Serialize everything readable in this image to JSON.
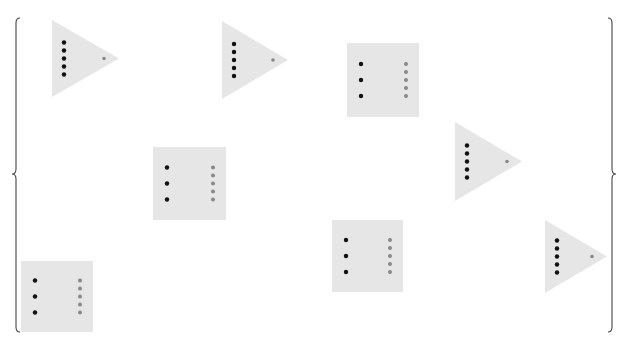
{
  "diagram": {
    "background": "#ffffff",
    "shape_fill": "#e6e6e6",
    "primary_dot_color": "#111111",
    "secondary_dot_color": "#888888",
    "brace_color": "#444444",
    "braces": [
      {
        "side": "left",
        "x": 16,
        "y_top": 18,
        "y_bottom": 332,
        "y_mid": 174
      },
      {
        "side": "right",
        "x": 612,
        "y_top": 18,
        "y_bottom": 332,
        "y_mid": 174
      }
    ],
    "triangles": [
      {
        "id": "triangle-1",
        "left": 52,
        "top": 20,
        "bottom": 97,
        "apex_x": 119,
        "black_dots": 5,
        "grey_dots": 1
      },
      {
        "id": "triangle-2",
        "left": 222,
        "top": 21,
        "bottom": 99,
        "apex_x": 288,
        "black_dots": 5,
        "grey_dots": 1
      },
      {
        "id": "triangle-3",
        "left": 455,
        "top": 122,
        "bottom": 201,
        "apex_x": 522,
        "black_dots": 5,
        "grey_dots": 1
      },
      {
        "id": "triangle-4",
        "left": 545,
        "top": 220,
        "bottom": 293,
        "apex_x": 607,
        "black_dots": 5,
        "grey_dots": 1
      }
    ],
    "squares": [
      {
        "id": "square-1",
        "x": 347,
        "y": 43,
        "w": 72,
        "h": 74,
        "black_dots": 3,
        "grey_dots": 5
      },
      {
        "id": "square-2",
        "x": 153,
        "y": 147,
        "w": 73,
        "h": 73,
        "black_dots": 3,
        "grey_dots": 5
      },
      {
        "id": "square-3",
        "x": 332,
        "y": 220,
        "w": 71,
        "h": 72,
        "black_dots": 3,
        "grey_dots": 5
      },
      {
        "id": "square-4",
        "x": 21,
        "y": 261,
        "w": 72,
        "h": 71,
        "black_dots": 3,
        "grey_dots": 5
      }
    ]
  }
}
